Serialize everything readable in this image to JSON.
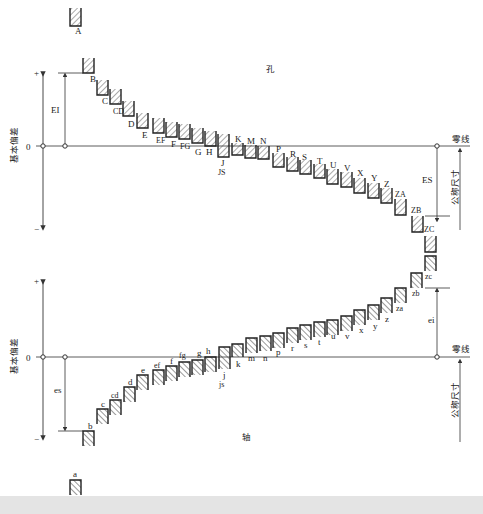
{
  "title_hole": "孔",
  "title_shaft": "轴",
  "axis": {
    "ylabel": "基本偏差",
    "plus": "+",
    "minus": "−",
    "zero": "0",
    "zero_line_label": "零线",
    "nominal_size_label": "公称尺寸"
  },
  "dimensions": {
    "EI": "EI",
    "ES": "ES",
    "es": "es",
    "ei": "ei"
  },
  "colors": {
    "line": "#333333",
    "hatch": "#444444",
    "background": "#ffffff",
    "footer": "#e4e4e4"
  },
  "holes": [
    {
      "label": "A",
      "x": 70,
      "top": 8,
      "bottom": 26,
      "lx": 75,
      "ly": 34
    },
    {
      "label": "B",
      "x": 83,
      "top": 58,
      "bottom": 73,
      "lx": 90,
      "ly": 82
    },
    {
      "label": "C",
      "x": 97,
      "top": 80,
      "bottom": 95,
      "lx": 102,
      "ly": 104
    },
    {
      "label": "CD",
      "x": 110,
      "top": 89,
      "bottom": 104,
      "lx": 113,
      "ly": 114
    },
    {
      "label": "D",
      "x": 123,
      "top": 101,
      "bottom": 116,
      "lx": 128,
      "ly": 127
    },
    {
      "label": "E",
      "x": 137,
      "top": 113,
      "bottom": 128,
      "lx": 142,
      "ly": 138
    },
    {
      "label": "EF",
      "x": 153,
      "top": 118,
      "bottom": 133,
      "lx": 156,
      "ly": 143
    },
    {
      "label": "F",
      "x": 166,
      "top": 122,
      "bottom": 137,
      "lx": 171,
      "ly": 147
    },
    {
      "label": "FG",
      "x": 179,
      "top": 124,
      "bottom": 139,
      "lx": 180,
      "ly": 149
    },
    {
      "label": "G",
      "x": 192,
      "top": 128,
      "bottom": 143,
      "lx": 195,
      "ly": 155
    },
    {
      "label": "H",
      "x": 205,
      "top": 131,
      "bottom": 146,
      "lx": 206,
      "ly": 155
    },
    {
      "label": "J",
      "x": 218,
      "top": 134,
      "bottom": 157,
      "lx": 221,
      "ly": 166
    },
    {
      "label": "JS",
      "x": 0,
      "top": 0,
      "bottom": 0,
      "lx": 218,
      "ly": 175,
      "text_only": true
    },
    {
      "label": "K",
      "x": 232,
      "top": 143,
      "bottom": 155,
      "lx": 235,
      "ly": 142
    },
    {
      "label": "M",
      "x": 245,
      "top": 145,
      "bottom": 158,
      "lx": 247,
      "ly": 144
    },
    {
      "label": "N",
      "x": 258,
      "top": 146,
      "bottom": 159,
      "lx": 260,
      "ly": 144
    },
    {
      "label": "P",
      "x": 273,
      "top": 153,
      "bottom": 167,
      "lx": 276,
      "ly": 152
    },
    {
      "label": "R",
      "x": 287,
      "top": 157,
      "bottom": 171,
      "lx": 290,
      "ly": 157
    },
    {
      "label": "S",
      "x": 300,
      "top": 160,
      "bottom": 174,
      "lx": 302,
      "ly": 160
    },
    {
      "label": "T",
      "x": 314,
      "top": 164,
      "bottom": 178,
      "lx": 317,
      "ly": 164
    },
    {
      "label": "U",
      "x": 327,
      "top": 169,
      "bottom": 184,
      "lx": 330,
      "ly": 168
    },
    {
      "label": "V",
      "x": 341,
      "top": 172,
      "bottom": 187,
      "lx": 344,
      "ly": 171
    },
    {
      "label": "X",
      "x": 354,
      "top": 178,
      "bottom": 193,
      "lx": 357,
      "ly": 176
    },
    {
      "label": "Y",
      "x": 368,
      "top": 183,
      "bottom": 198,
      "lx": 371,
      "ly": 181
    },
    {
      "label": "Z",
      "x": 381,
      "top": 188,
      "bottom": 203,
      "lx": 384,
      "ly": 187
    },
    {
      "label": "ZA",
      "x": 395,
      "top": 199,
      "bottom": 215,
      "lx": 395,
      "ly": 197
    },
    {
      "label": "ZB",
      "x": 412,
      "top": 216,
      "bottom": 232,
      "lx": 411,
      "ly": 213
    },
    {
      "label": "ZC",
      "x": 425,
      "top": 236,
      "bottom": 252,
      "lx": 424,
      "ly": 232
    }
  ],
  "shafts": [
    {
      "label": "zc",
      "x": 425,
      "top": 256,
      "bottom": 271,
      "lx": 425,
      "ly": 279
    },
    {
      "label": "zb",
      "x": 411,
      "top": 273,
      "bottom": 288,
      "lx": 412,
      "ly": 296
    },
    {
      "label": "za",
      "x": 395,
      "top": 288,
      "bottom": 303,
      "lx": 396,
      "ly": 311
    },
    {
      "label": "z",
      "x": 381,
      "top": 298,
      "bottom": 313,
      "lx": 385,
      "ly": 322
    },
    {
      "label": "y",
      "x": 368,
      "top": 305,
      "bottom": 320,
      "lx": 373,
      "ly": 329
    },
    {
      "label": "x",
      "x": 354,
      "top": 310,
      "bottom": 325,
      "lx": 359,
      "ly": 333
    },
    {
      "label": "v",
      "x": 341,
      "top": 316,
      "bottom": 331,
      "lx": 345,
      "ly": 339
    },
    {
      "label": "u",
      "x": 327,
      "top": 320,
      "bottom": 335,
      "lx": 331,
      "ly": 339
    },
    {
      "label": "t",
      "x": 314,
      "top": 322,
      "bottom": 337,
      "lx": 318,
      "ly": 345
    },
    {
      "label": "s",
      "x": 300,
      "top": 325,
      "bottom": 340,
      "lx": 304,
      "ly": 348
    },
    {
      "label": "r",
      "x": 287,
      "top": 328,
      "bottom": 343,
      "lx": 291,
      "ly": 351
    },
    {
      "label": "p",
      "x": 273,
      "top": 333,
      "bottom": 348,
      "lx": 276,
      "ly": 355
    },
    {
      "label": "n",
      "x": 260,
      "top": 336,
      "bottom": 351,
      "lx": 263,
      "ly": 361
    },
    {
      "label": "m",
      "x": 246,
      "top": 338,
      "bottom": 353,
      "lx": 248,
      "ly": 361
    },
    {
      "label": "k",
      "x": 232,
      "top": 344,
      "bottom": 357,
      "lx": 236,
      "ly": 367
    },
    {
      "label": "j",
      "x": 219,
      "top": 347,
      "bottom": 369,
      "lx": 223,
      "ly": 378
    },
    {
      "label": "js",
      "x": 0,
      "top": 0,
      "bottom": 0,
      "lx": 219,
      "ly": 387,
      "text_only": true
    },
    {
      "label": "h",
      "x": 205,
      "top": 357,
      "bottom": 372,
      "lx": 206,
      "ly": 354
    },
    {
      "label": "g",
      "x": 192,
      "top": 360,
      "bottom": 375,
      "lx": 197,
      "ly": 356
    },
    {
      "label": "fg",
      "x": 179,
      "top": 362,
      "bottom": 377,
      "lx": 179,
      "ly": 358
    },
    {
      "label": "f",
      "x": 166,
      "top": 366,
      "bottom": 381,
      "lx": 170,
      "ly": 364
    },
    {
      "label": "ef",
      "x": 153,
      "top": 370,
      "bottom": 385,
      "lx": 154,
      "ly": 368
    },
    {
      "label": "e",
      "x": 137,
      "top": 375,
      "bottom": 390,
      "lx": 141,
      "ly": 373
    },
    {
      "label": "d",
      "x": 124,
      "top": 387,
      "bottom": 402,
      "lx": 128,
      "ly": 385
    },
    {
      "label": "cd",
      "x": 110,
      "top": 400,
      "bottom": 415,
      "lx": 111,
      "ly": 398
    },
    {
      "label": "c",
      "x": 97,
      "top": 409,
      "bottom": 424,
      "lx": 101,
      "ly": 407
    },
    {
      "label": "b",
      "x": 83,
      "top": 431,
      "bottom": 446,
      "lx": 88,
      "ly": 429
    },
    {
      "label": "a",
      "x": 70,
      "top": 480,
      "bottom": 495,
      "lx": 73,
      "ly": 477
    }
  ]
}
